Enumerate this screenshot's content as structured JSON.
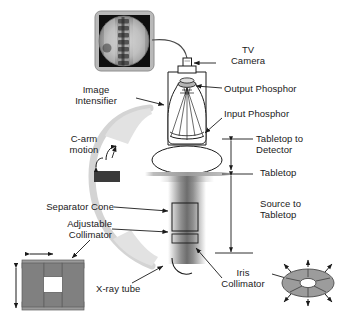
{
  "figure": {
    "type": "technical-diagram",
    "background_color": "#ffffff",
    "line_color": "#1a1a1a",
    "palette": {
      "mid_gray": "#808080",
      "dark_gray": "#3a3a3a",
      "light_gray": "#c9c9c9",
      "bezel_gray": "#b5b5b5",
      "screen_black": "#101010",
      "carm_gray": "#d6d6d6"
    }
  },
  "labels": {
    "tv_camera": "TV\nCamera",
    "output_phosphor": "Output Phosphor",
    "input_phosphor": "Input Phosphor",
    "image_intensifier": "Image\nIntensifier",
    "c_arm_motion": "C-arm\nmotion",
    "tabletop_to_detector": "Tabletop to\nDetector",
    "tabletop": "Tabletop",
    "source_to_tabletop": "Source to\nTabletop",
    "separator_cone": "Separator Cone",
    "adjustable_collimator": "Adjustable\nCollimator",
    "xray_tube": "X-ray tube",
    "iris_collimator": "Iris\nCollimator"
  },
  "components": [
    {
      "name": "monitor",
      "label": "fluoroscopic display monitor",
      "content": "circular spine fluoroscopy image"
    },
    {
      "name": "tv-camera",
      "label": "TV Camera"
    },
    {
      "name": "image-intensifier",
      "label": "Image Intensifier"
    },
    {
      "name": "output-phosphor",
      "label": "Output Phosphor"
    },
    {
      "name": "input-phosphor",
      "label": "Input Phosphor"
    },
    {
      "name": "patient-table-ellipse",
      "label": "patient cross-section"
    },
    {
      "name": "tabletop",
      "label": "Tabletop"
    },
    {
      "name": "separator-cone",
      "label": "Separator Cone"
    },
    {
      "name": "xray-tube",
      "label": "X-ray tube"
    },
    {
      "name": "iris-collimator",
      "label": "Iris Collimator"
    },
    {
      "name": "adjustable-collimator",
      "label": "Adjustable Collimator"
    },
    {
      "name": "c-arm",
      "label": "C-arm support"
    }
  ],
  "dimension_lines": [
    {
      "name": "tabletop-to-detector",
      "label": "Tabletop to Detector"
    },
    {
      "name": "source-to-tabletop",
      "label": "Source to Tabletop"
    }
  ],
  "insets": {
    "adjustable_collimator": {
      "arrows": [
        "horizontal-double-arrow",
        "vertical-double-arrow"
      ],
      "aperture": "rectangular"
    },
    "iris_collimator": {
      "arrows": 8,
      "shape": "elliptical-leaf-iris"
    }
  }
}
